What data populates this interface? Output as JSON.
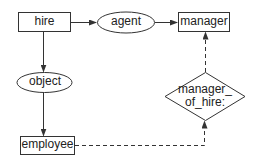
{
  "diagram": {
    "nodes": [
      {
        "id": "hire",
        "label": "hire",
        "shape": "rectangle"
      },
      {
        "id": "agent",
        "label": "agent",
        "shape": "ellipse"
      },
      {
        "id": "manager",
        "label": "manager",
        "shape": "rectangle"
      },
      {
        "id": "object",
        "label": "object",
        "shape": "ellipse"
      },
      {
        "id": "employee",
        "label": "employee",
        "shape": "rectangle"
      },
      {
        "id": "manager_of_hire",
        "label_line1": "manager_",
        "label_line2": "of_hire:",
        "shape": "diamond"
      }
    ],
    "edges": [
      {
        "from": "hire",
        "to": "agent",
        "style": "solid"
      },
      {
        "from": "agent",
        "to": "manager",
        "style": "solid"
      },
      {
        "from": "hire",
        "to": "object",
        "style": "solid"
      },
      {
        "from": "object",
        "to": "employee",
        "style": "solid"
      },
      {
        "from": "employee",
        "to": "manager_of_hire",
        "style": "dashed"
      },
      {
        "from": "manager_of_hire",
        "to": "manager",
        "style": "dashed"
      }
    ],
    "colors": {
      "stroke": "#333333",
      "text": "#222222",
      "background": "#ffffff"
    }
  }
}
